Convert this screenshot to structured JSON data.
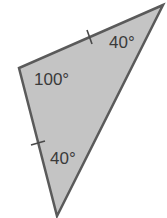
{
  "figure": {
    "type": "triangle",
    "fill_color": "#c4c4c4",
    "stroke_color": "#5a5a5a",
    "vertices": {
      "top_right": [
        163,
        5
      ],
      "left": [
        19,
        68
      ],
      "bottom": [
        57,
        216
      ]
    },
    "angles": [
      {
        "vertex": "top_right",
        "label": "40°"
      },
      {
        "vertex": "left",
        "label": "100°"
      },
      {
        "vertex": "bottom",
        "label": "40°"
      }
    ],
    "congruent_sides": [
      "top",
      "left"
    ]
  }
}
